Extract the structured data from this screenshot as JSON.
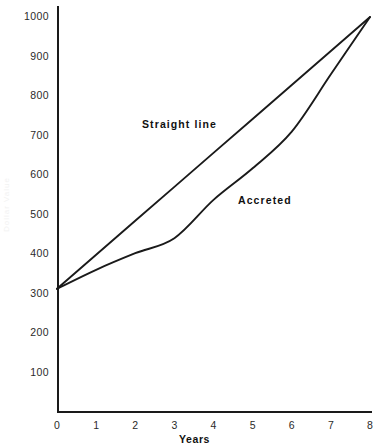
{
  "chart_data": {
    "type": "line",
    "title": "",
    "xlabel": "Years",
    "ylabel": "",
    "xlim": [
      0,
      8
    ],
    "ylim": [
      0,
      1000
    ],
    "grid": false,
    "legend": "inline-annotations",
    "x_ticks": [
      "0",
      "1",
      "2",
      "3",
      "4",
      "5",
      "6",
      "7",
      "8"
    ],
    "x_tick_values": [
      0,
      1,
      2,
      3,
      4,
      5,
      6,
      7,
      8
    ],
    "y_ticks": [
      "100",
      "200",
      "300",
      "400",
      "500",
      "600",
      "700",
      "800",
      "900",
      "1000"
    ],
    "y_tick_values": [
      100,
      200,
      300,
      400,
      500,
      600,
      700,
      800,
      900,
      1000
    ],
    "x": [
      0,
      1,
      2,
      3,
      4,
      5,
      6,
      7,
      8
    ],
    "series": [
      {
        "name": "Straight line",
        "values": [
          312,
          398,
          484,
          570,
          656,
          742,
          828,
          914,
          1000
        ],
        "color": "#1a1a1a"
      },
      {
        "name": "Accreted",
        "values": [
          312,
          360,
          402,
          440,
          537,
          617,
          710,
          855,
          1000
        ],
        "color": "#1a1a1a"
      }
    ],
    "annotations": [
      {
        "text": "Straight line",
        "x": 2.2,
        "y": 740
      },
      {
        "text": "Accreted",
        "x": 4.6,
        "y": 545
      }
    ]
  },
  "axes": {
    "x_title": "Years",
    "y_title": "Dollar Value"
  },
  "labels": {
    "straight_line": "Straight line",
    "accreted": "Accreted"
  },
  "colors": {
    "line": "#1a1a1a",
    "axis": "#1a1a1a",
    "text": "#2a2a2a",
    "background": "#ffffff"
  }
}
